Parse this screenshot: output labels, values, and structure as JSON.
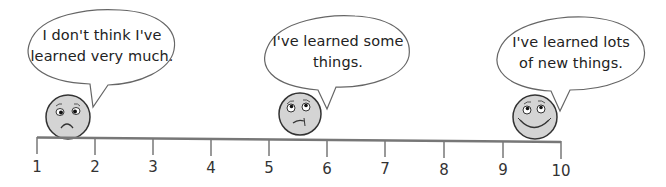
{
  "scale": {
    "title": "Learning self-assessment scale",
    "min": 1,
    "max": 10,
    "ticks": [
      "1",
      "2",
      "3",
      "4",
      "5",
      "6",
      "7",
      "8",
      "9",
      "10"
    ],
    "line_color": "#777777"
  },
  "faces": [
    {
      "mood": "sad",
      "position": 1.5,
      "speech": {
        "line1": "I don't think I've",
        "line2": "learned very much."
      }
    },
    {
      "mood": "unsure",
      "position": 5.5,
      "speech": {
        "line1": "I've learned some",
        "line2": "things."
      }
    },
    {
      "mood": "happy",
      "position": 9.5,
      "speech": {
        "line1": "I've learned lots",
        "line2": "of new things."
      }
    }
  ],
  "colors": {
    "face_fill": "#d4d4d4",
    "outline": "#333333",
    "bubble_stroke": "#666666"
  }
}
